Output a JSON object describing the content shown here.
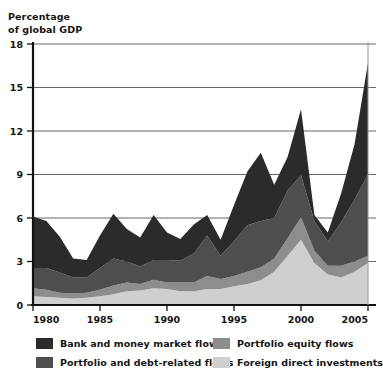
{
  "axis_title": "Percentage\nof global GDP",
  "legend": {
    "items": [
      {
        "label": "Bank and money market flows",
        "color": "#2b2b2b"
      },
      {
        "label": "Portfolio and debt-related flows",
        "color": "#4e4e4e"
      },
      {
        "label": "Portfolio equity flows",
        "color": "#8d8d8d"
      },
      {
        "label": "Foreign direct investments",
        "color": "#cfcfcf"
      }
    ]
  },
  "chart_data": {
    "type": "area",
    "stacked": true,
    "title": "",
    "xlabel": "",
    "ylabel": "Percentage of global GDP",
    "xlim": [
      1980,
      2005
    ],
    "ylim": [
      0,
      18
    ],
    "grid": true,
    "grid_axis": "y",
    "legend_position": "bottom",
    "ytick_labels": [
      "0",
      "3",
      "6",
      "9",
      "12",
      "15",
      "18"
    ],
    "yticks": [
      0,
      3,
      6,
      9,
      12,
      15,
      18
    ],
    "xtick_labels": [
      "1980",
      "1985",
      "1990",
      "1995",
      "2000",
      "2005"
    ],
    "xticks": [
      1980,
      1985,
      1990,
      1995,
      2000,
      2005
    ],
    "x": [
      1980,
      1981,
      1982,
      1983,
      1984,
      1985,
      1986,
      1987,
      1988,
      1989,
      1990,
      1991,
      1992,
      1993,
      1994,
      1995,
      1996,
      1997,
      1998,
      1999,
      2000,
      2001,
      2002,
      2003,
      2004,
      2005
    ],
    "series": [
      {
        "name": "Foreign direct investments",
        "color": "#cfcfcf",
        "values": [
          0.6,
          0.55,
          0.5,
          0.45,
          0.5,
          0.6,
          0.75,
          0.95,
          1.0,
          1.15,
          1.1,
          0.95,
          0.95,
          1.1,
          1.1,
          1.3,
          1.45,
          1.7,
          2.3,
          3.4,
          4.5,
          2.9,
          2.1,
          1.9,
          2.3,
          2.9
        ]
      },
      {
        "name": "Portfolio equity flows",
        "color": "#8d8d8d",
        "values": [
          0.55,
          0.5,
          0.35,
          0.35,
          0.35,
          0.45,
          0.6,
          0.6,
          0.45,
          0.6,
          0.45,
          0.6,
          0.6,
          0.9,
          0.7,
          0.7,
          0.85,
          0.9,
          0.9,
          1.2,
          1.55,
          0.85,
          0.6,
          0.8,
          0.7,
          0.5
        ]
      },
      {
        "name": "Portfolio and debt-related flows",
        "color": "#4e4e4e",
        "values": [
          1.4,
          1.5,
          1.4,
          1.1,
          1.05,
          1.5,
          1.85,
          1.45,
          1.2,
          1.35,
          1.55,
          1.5,
          2.0,
          2.8,
          1.6,
          2.4,
          3.2,
          3.2,
          2.8,
          3.3,
          2.9,
          2.05,
          1.7,
          3.0,
          4.3,
          5.6
        ]
      },
      {
        "name": "Bank and money market flows",
        "color": "#2b2b2b",
        "values": [
          3.55,
          3.25,
          2.45,
          1.3,
          1.2,
          2.25,
          3.1,
          2.25,
          2.0,
          3.1,
          1.9,
          1.5,
          2.0,
          1.4,
          1.1,
          2.5,
          3.7,
          4.7,
          2.3,
          2.3,
          4.55,
          0.4,
          0.6,
          2.0,
          3.8,
          7.7
        ]
      }
    ],
    "totals": [
      6.1,
      5.8,
      4.7,
      3.2,
      3.1,
      4.8,
      6.3,
      5.25,
      4.65,
      6.2,
      5.0,
      4.55,
      5.55,
      6.2,
      4.5,
      6.9,
      9.2,
      10.5,
      8.3,
      10.2,
      13.5,
      6.2,
      5.0,
      7.7,
      11.1,
      16.7
    ]
  }
}
